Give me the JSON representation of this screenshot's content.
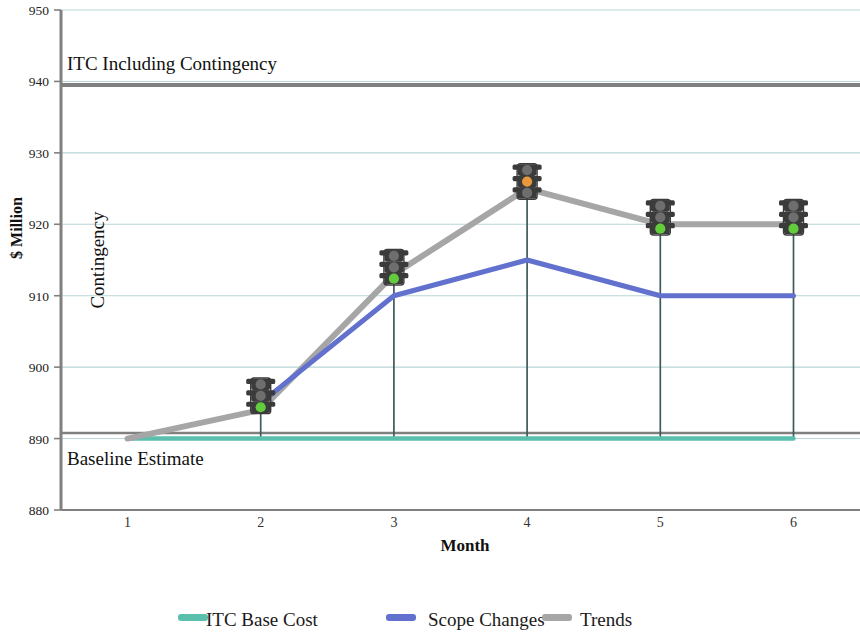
{
  "chart_data": {
    "type": "line",
    "title": "",
    "xlabel": "Month",
    "ylabel": "$ Million",
    "x": [
      1,
      2,
      3,
      4,
      5,
      6
    ],
    "xtick_labels": [
      "1",
      "2",
      "3",
      "4",
      "5",
      "6"
    ],
    "ytick_labels": [
      "880",
      "890",
      "900",
      "910",
      "920",
      "930",
      "940",
      "950"
    ],
    "ylim": [
      880,
      950
    ],
    "xlim": [
      0.5,
      6.5
    ],
    "grid": "horizontal",
    "legend_position": "bottom",
    "series": [
      {
        "name": "ITC Base Cost",
        "color": "#5bbfae",
        "values": [
          890,
          890,
          890,
          890,
          890,
          890
        ]
      },
      {
        "name": "Scope Changes",
        "color": "#6271ce",
        "values": [
          null,
          895,
          910,
          915,
          910,
          910
        ]
      },
      {
        "name": "Trends",
        "color": "#a6a6a6",
        "values": [
          890,
          894,
          913,
          925,
          920,
          920
        ]
      }
    ],
    "reference_lines": [
      {
        "name": "ITC Including Contingency",
        "value": 940,
        "color": "#808080"
      },
      {
        "name": "Baseline Estimate",
        "value": 890,
        "color": "#808080"
      }
    ],
    "annotations": [
      {
        "text": "ITC Including Contingency",
        "x": 1.15,
        "y": 943
      },
      {
        "text": "Baseline Estimate",
        "x": 1.1,
        "y": 886
      },
      {
        "text": "Contingency",
        "x": 1.15,
        "y": 915,
        "rotation": -90
      }
    ],
    "status_markers": [
      {
        "month": 2,
        "value": 895,
        "status": "green",
        "label": "green-status"
      },
      {
        "month": 3,
        "value": 913,
        "status": "green",
        "label": "green-status"
      },
      {
        "month": 4,
        "value": 925,
        "status": "amber",
        "label": "amber-status"
      },
      {
        "month": 5,
        "value": 920,
        "status": "green",
        "label": "green-status"
      },
      {
        "month": 6,
        "value": 920,
        "status": "green",
        "label": "green-status"
      }
    ]
  },
  "axis": {
    "y_title": "$ Million",
    "x_title": "Month",
    "y_ticks": [
      "950",
      "940",
      "930",
      "920",
      "910",
      "900",
      "890",
      "880"
    ],
    "x_ticks": [
      "1",
      "2",
      "3",
      "4",
      "5",
      "6"
    ]
  },
  "annotations": {
    "itc_including_contingency": "ITC Including Contingency",
    "baseline_estimate": "Baseline Estimate",
    "contingency": "Contingency"
  },
  "legend": {
    "items": [
      {
        "label": "ITC Base Cost",
        "color": "#5bbfae"
      },
      {
        "label": "Scope Changes",
        "color": "#6271ce"
      },
      {
        "label": "Trends",
        "color": "#a6a6a6"
      }
    ]
  },
  "colors": {
    "itc_base_cost": "#5bbfae",
    "scope_changes": "#6271ce",
    "trends": "#a6a6a6",
    "axis": "#808080",
    "gridline": "#b9d6d6",
    "traffic_green": "#63cc3d",
    "traffic_amber": "#e8973a",
    "traffic_body": "#3b3b3b",
    "dropline": "#3f5a5a"
  }
}
